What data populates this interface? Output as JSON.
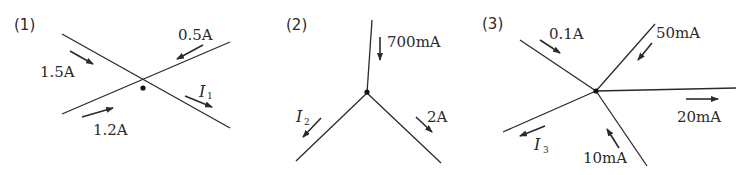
{
  "diagrams": [
    {
      "label": "(1)",
      "currents": [
        {
          "name": "in_upper_left",
          "text": "1.5A",
          "direction": "into junction"
        },
        {
          "name": "in_upper_right",
          "text": "0.5A",
          "direction": "into junction"
        },
        {
          "name": "in_lower_left",
          "text": "1.2A",
          "direction": "into junction"
        },
        {
          "name": "out_lower_right",
          "text": "I",
          "subscript": "1",
          "direction": "out of junction"
        }
      ]
    },
    {
      "label": "(2)",
      "currents": [
        {
          "name": "in_top",
          "text": "700mA",
          "direction": "into junction"
        },
        {
          "name": "out_lower_left",
          "text": "I",
          "subscript": "2",
          "direction": "out of junction"
        },
        {
          "name": "out_lower_right",
          "text": "2A",
          "direction": "out of junction"
        }
      ]
    },
    {
      "label": "(3)",
      "currents": [
        {
          "name": "in_upper_left",
          "text": "0.1A",
          "direction": "into junction"
        },
        {
          "name": "in_upper_right",
          "text": "50mA",
          "direction": "into junction"
        },
        {
          "name": "out_right",
          "text": "20mA",
          "direction": "out of junction"
        },
        {
          "name": "in_bottom",
          "text": "10mA",
          "direction": "into junction"
        },
        {
          "name": "out_lower_left",
          "text": "I",
          "subscript": "3",
          "direction": "out of junction"
        }
      ]
    }
  ]
}
